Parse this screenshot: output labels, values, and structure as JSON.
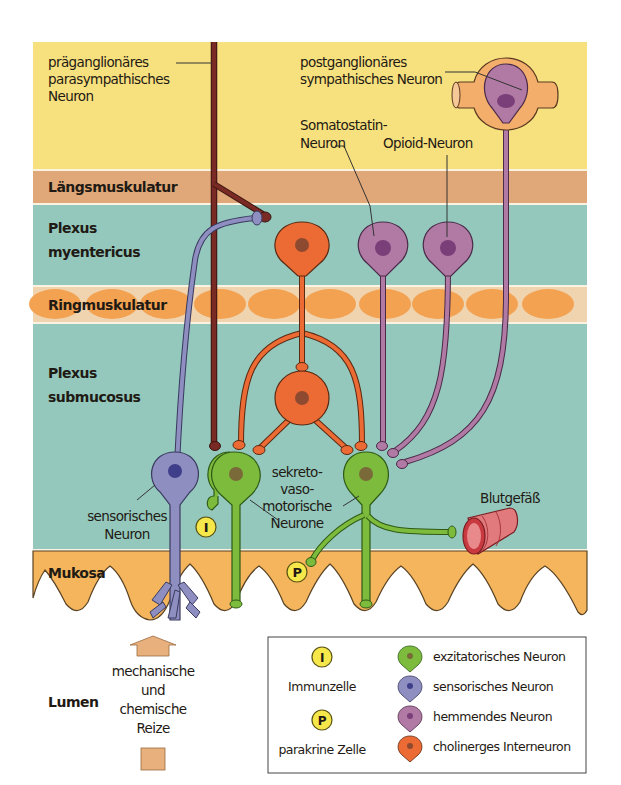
{
  "layers": {
    "serosa_top": {
      "color": "#f7e07e"
    },
    "laengsmuskulatur": {
      "label": "Längsmuskulatur",
      "color": "#e0a878"
    },
    "plexus_myentericus": {
      "label_line1": "Plexus",
      "label_line2": "myentericus",
      "color": "#94c8bd"
    },
    "ringmuskulatur": {
      "label": "Ringmuskulatur",
      "color": "#f0d4b0",
      "oval_color": "#f3a252"
    },
    "plexus_submucosus": {
      "label_line1": "Plexus",
      "label_line2": "submucosus",
      "color": "#94c8bd"
    },
    "mukosa": {
      "label": "Mukosa",
      "color": "#f4b55c"
    },
    "lumen": {
      "label": "Lumen"
    }
  },
  "labels": {
    "praeganglionaer": {
      "line1": "präganglionäres",
      "line2": "parasympathisches",
      "line3": "Neuron"
    },
    "postganglionaer": {
      "line1": "postganglionäres",
      "line2": "sympathisches Neuron"
    },
    "somatostatin": {
      "line1": "Somatostatin-",
      "line2": "Neuron"
    },
    "opioid": {
      "label": "Opioid-Neuron"
    },
    "sensorisch": {
      "line1": "sensorisches",
      "line2": "Neuron"
    },
    "sekretomotorisch": {
      "line1": "sekreto-",
      "line2": "vaso-",
      "line3": "motorische",
      "line4": "Neurone"
    },
    "blutgefaess": {
      "label": "Blutgefäß"
    },
    "reize": {
      "line1": "mechanische",
      "line2": "und",
      "line3": "chemische",
      "line4": "Reize"
    }
  },
  "markers": {
    "immunzelle": {
      "letter": "I"
    },
    "parakrin": {
      "letter": "P"
    }
  },
  "legend": {
    "left": [
      {
        "letter": "I",
        "label": "Immunzelle"
      },
      {
        "letter": "P",
        "label": "parakrine Zelle"
      }
    ],
    "right": [
      {
        "label": "exzitatorisches Neuron",
        "color": "#7dbb3c",
        "nucleus": "#7a6a3a"
      },
      {
        "label": "sensorisches Neuron",
        "color": "#8e8ec0",
        "nucleus": "#3e3e8a"
      },
      {
        "label": "hemmendes Neuron",
        "color": "#b07aa4",
        "nucleus": "#7a3e78"
      },
      {
        "label": "cholinerges Interneuron",
        "color": "#ec6a33",
        "nucleus": "#8e4a30"
      }
    ]
  },
  "colors": {
    "excitatory": "#7dbb3c",
    "sensory": "#8e8ec0",
    "inhibitory": "#b07aa4",
    "cholinergic": "#ec6a33",
    "preganglionic": "#7a2a24",
    "marker": "#f6e84a",
    "vessel": "#d9555b",
    "arrow": "#e8b07c"
  }
}
